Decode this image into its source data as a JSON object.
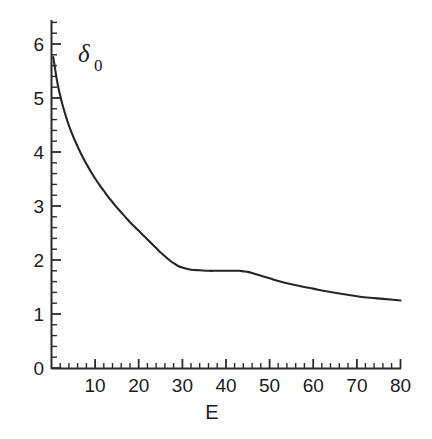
{
  "chart_data": {
    "type": "line",
    "title": "",
    "subtitle": "",
    "xlabel": "E",
    "ylabel": "δ",
    "ylabel_subscript": "0",
    "ylabel_full": "δ₀",
    "xlim": [
      0,
      82
    ],
    "ylim": [
      0,
      6.4
    ],
    "x_ticks": [
      10,
      20,
      30,
      40,
      50,
      60,
      70,
      80
    ],
    "x_tick_labels": [
      "10",
      "20",
      "30",
      "40",
      "50",
      "60",
      "70",
      "80"
    ],
    "x_minor_step": 2,
    "y_ticks": [
      0,
      1,
      2,
      3,
      4,
      5,
      6
    ],
    "y_tick_labels": [
      "0",
      "1",
      "2",
      "3",
      "4",
      "5",
      "6"
    ],
    "y_minor_step": 0.2,
    "grid": false,
    "legend": false,
    "legend_position": "none",
    "series": [
      {
        "name": "delta_0",
        "color": "#262626",
        "x": [
          0.4,
          0.8,
          1.2,
          1.6,
          2.0,
          2.5,
          3.0,
          3.5,
          4.0,
          5.0,
          6.0,
          7.0,
          8.0,
          9.0,
          10.0,
          11.0,
          12.0,
          13.0,
          14.0,
          15.0,
          16.0,
          17.0,
          18.0,
          19.0,
          20.0,
          21.0,
          22.0,
          23.0,
          24.0,
          25.0,
          26.0,
          27.0,
          28.0,
          29.0,
          30.0,
          32.0,
          34.0,
          36.0,
          38.0,
          40.0,
          42.0,
          43.0,
          44.0,
          45.0,
          46.0,
          48.0,
          50.0,
          52.0,
          55.0,
          58.0,
          60.0,
          63.0,
          66.0,
          70.0,
          73.0,
          76.0,
          80.0
        ],
        "y": [
          5.76,
          5.55,
          5.35,
          5.18,
          5.04,
          4.88,
          4.74,
          4.61,
          4.49,
          4.28,
          4.1,
          3.93,
          3.78,
          3.64,
          3.51,
          3.39,
          3.28,
          3.17,
          3.07,
          2.97,
          2.88,
          2.79,
          2.7,
          2.62,
          2.54,
          2.46,
          2.38,
          2.3,
          2.22,
          2.14,
          2.07,
          2.0,
          1.94,
          1.89,
          1.86,
          1.82,
          1.81,
          1.8,
          1.8,
          1.8,
          1.8,
          1.8,
          1.79,
          1.78,
          1.76,
          1.71,
          1.66,
          1.61,
          1.55,
          1.5,
          1.47,
          1.42,
          1.38,
          1.33,
          1.3,
          1.28,
          1.25
        ]
      }
    ],
    "annotations": [
      {
        "text": "δ₀",
        "x": 11,
        "y": 5.9,
        "role": "y-axis-label-inside-plot"
      }
    ]
  }
}
